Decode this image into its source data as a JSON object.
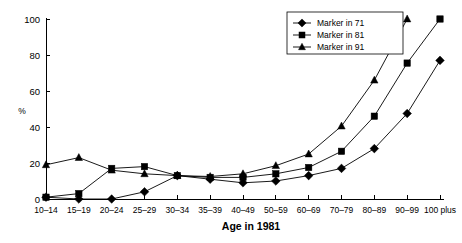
{
  "chart_data": {
    "type": "line",
    "title": "",
    "xlabel": "Age in 1981",
    "ylabel": "%",
    "categories": [
      "10–14",
      "15–19",
      "20–24",
      "25–29",
      "30–34",
      "35–39",
      "40–49",
      "50–59",
      "60–69",
      "70–79",
      "80–89",
      "90–99",
      "100 plus"
    ],
    "ylim": [
      0,
      100
    ],
    "yticks": [
      0,
      20,
      40,
      60,
      80,
      100
    ],
    "ytick_labels": [
      "0",
      "20",
      "40",
      "60",
      "80",
      "100"
    ],
    "grid": false,
    "legend_position": "top-right",
    "series": [
      {
        "name": "Marker in 71",
        "marker": "diamond",
        "values": [
          1,
          0,
          0,
          4,
          13,
          11,
          9,
          10,
          13,
          17,
          28,
          47.5,
          77
        ]
      },
      {
        "name": "Marker in 81",
        "marker": "square",
        "values": [
          1,
          3,
          17,
          18,
          13,
          12,
          12,
          14,
          17.5,
          26.5,
          46,
          75.5,
          100
        ]
      },
      {
        "name": "Marker in 91",
        "marker": "triangle",
        "values": [
          19,
          23,
          16,
          14,
          13,
          12.5,
          14,
          18.5,
          25,
          40.5,
          66,
          100,
          null
        ]
      }
    ]
  },
  "legend": {
    "entries": [
      {
        "label": "Marker in 71"
      },
      {
        "label": "Marker in 81"
      },
      {
        "label": "Marker in 91"
      }
    ]
  }
}
